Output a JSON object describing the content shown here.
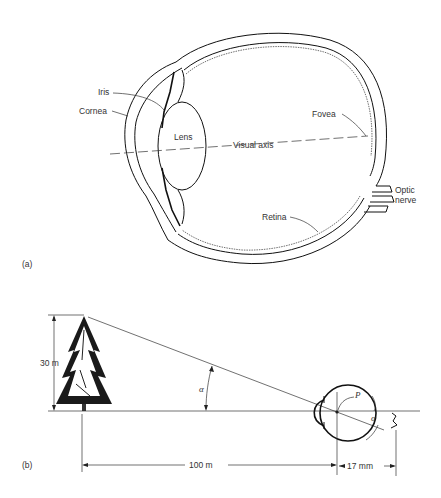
{
  "figure": {
    "panel_a": {
      "panel_label": "(a)",
      "title": "Cross-section of the human eye",
      "labels": {
        "iris": "Iris",
        "cornea": "Cornea",
        "lens": "Lens",
        "visual_axis": "Visual axis",
        "fovea": "Fovea",
        "optic_nerve_line1": "Optic",
        "optic_nerve_line2": "nerve",
        "retina": "Retina"
      }
    },
    "panel_b": {
      "panel_label": "(b)",
      "title": "Retinal image size geometry",
      "labels": {
        "tree_height": "30 m",
        "distance": "100 m",
        "eye_depth": "17 mm",
        "angle_alpha": "α",
        "angle_alpha_eye": "α",
        "nodal_point": "P"
      }
    }
  }
}
